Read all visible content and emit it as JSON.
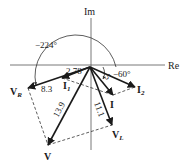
{
  "diagram": {
    "type": "phasor-diagram",
    "axes": {
      "real_label": "Re",
      "imag_label": "Im"
    },
    "angles": {
      "large_angle": "−224°",
      "small_angle": "−60°"
    },
    "phasors": [
      {
        "id": "VR",
        "label": "V",
        "subscript": "R",
        "magnitude_label": "8.3"
      },
      {
        "id": "V",
        "label": "V",
        "subscript": "",
        "magnitude_label": "13.9"
      },
      {
        "id": "VL",
        "label": "V",
        "subscript": "L",
        "magnitude_label": "11.1"
      },
      {
        "id": "I",
        "label": "I",
        "subscript": "",
        "magnitude_label": "5"
      },
      {
        "id": "I1",
        "label": "I",
        "subscript": "1",
        "magnitude_label": "2.78"
      },
      {
        "id": "I2",
        "label": "I",
        "subscript": "2",
        "magnitude_label": ""
      }
    ]
  }
}
